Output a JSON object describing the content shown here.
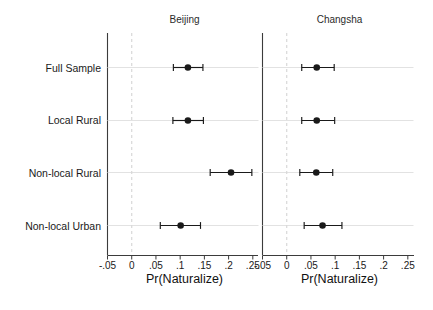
{
  "chart_data": {
    "type": "scatter",
    "title": "",
    "subtitle": "",
    "xlabel": "Pr(Naturalize)",
    "ylabel": "",
    "grid": true,
    "legend_position": "none",
    "orientation": "horizontal",
    "marker_style": "filled-circle-with-horizontal-error-bars",
    "xlim": [
      -0.05,
      0.27
    ],
    "xticks": [
      -0.05,
      0,
      0.05,
      0.1,
      0.15,
      0.2,
      0.25
    ],
    "xticklabels": [
      "-.05",
      "0",
      ".05",
      ".1",
      ".15",
      ".2",
      ".25"
    ],
    "categories": [
      "Full Sample",
      "Local Rural",
      "Non-local Rural",
      "Non-local Urban"
    ],
    "reference_line": 0,
    "reference_line_style": "dashed",
    "panels": [
      {
        "name": "Beijing",
        "xlabel": "Pr(Naturalize)",
        "values": [
          0.116,
          0.116,
          0.205,
          0.101
        ],
        "ci_low": [
          0.086,
          0.085,
          0.162,
          0.059
        ],
        "ci_high": [
          0.147,
          0.148,
          0.248,
          0.142
        ]
      },
      {
        "name": "Changsha",
        "xlabel": "Pr(Naturalize)",
        "values": [
          0.062,
          0.062,
          0.061,
          0.074
        ],
        "ci_low": [
          0.031,
          0.031,
          0.027,
          0.036
        ],
        "ci_high": [
          0.098,
          0.099,
          0.095,
          0.114
        ]
      }
    ]
  },
  "panel_titles": {
    "left": "Beijing",
    "right": "Changsha"
  },
  "category_labels": {
    "c0": "Full Sample",
    "c1": "Local Rural",
    "c2": "Non-local Rural",
    "c3": "Non-local Urban"
  },
  "axis_titles": {
    "left": "Pr(Naturalize)",
    "right": "Pr(Naturalize)"
  },
  "tick_labels": {
    "t0": "-.05",
    "t1": "0",
    "t2": ".05",
    "t3": ".1",
    "t4": ".15",
    "t5": ".2",
    "t6": ".25"
  },
  "colors": {
    "marker": "#1a1a1a",
    "axis": "#3b3b3b",
    "grid": "#e2e2e2",
    "reference": "#d8d8d8",
    "background": "#ffffff"
  }
}
